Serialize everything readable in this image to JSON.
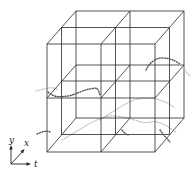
{
  "figure": {
    "grid": {
      "divisions_x": 2,
      "divisions_y": 2,
      "divisions_t": 2
    },
    "axes": {
      "y_label": "y",
      "x_label": "x",
      "t_label": "t"
    },
    "colors": {
      "edges": "#2a2a2a",
      "trajectory_front": "#555555",
      "trajectory_back": "#bdbdbd"
    }
  }
}
